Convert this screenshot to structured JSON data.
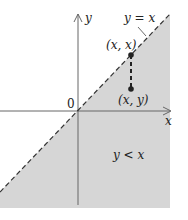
{
  "diagram": {
    "axes": {
      "x_label": "x",
      "y_label": "y",
      "origin_label": "0"
    },
    "line": {
      "label": "y = x",
      "style": "dashed"
    },
    "points": [
      {
        "label": "(x, x)"
      },
      {
        "label": "(x, y)"
      }
    ],
    "region": {
      "label": "y < x",
      "fill": "#d6d6d6"
    },
    "colors": {
      "axis": "#555555",
      "line": "#333333",
      "shade": "#d6d6d6"
    }
  }
}
